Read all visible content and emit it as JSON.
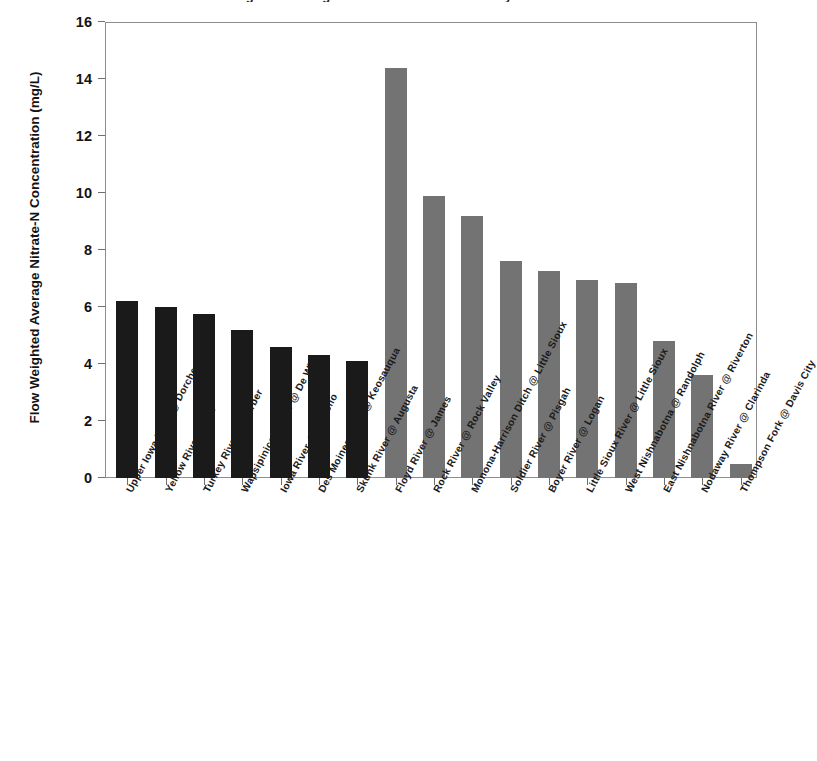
{
  "chart_data": {
    "type": "bar",
    "title": "Flow Weighted Average Nitrate-N Concentration by Watershed",
    "xlabel": "",
    "ylabel": "Flow Weighted Average Nitrate-N Concentration (mg/L)",
    "ylim": [
      0,
      16
    ],
    "yticks": [
      0,
      2,
      4,
      6,
      8,
      10,
      12,
      14,
      16
    ],
    "grid": false,
    "legend": "none",
    "categories": [
      "Upper Iowa River @ Dorchester",
      "Yellow River @ Ion",
      "Turkey River @ Garber",
      "Wapsipinicon River @ De Witt",
      "Iowa River @ Wapello",
      "Des Moines River @ Keosauqua",
      "Skunk River @ Augusta",
      "Floyd River @ James",
      "Rock River @ Rock Valley",
      "Monona-Harrison Ditch @ Little Sioux",
      "Soldier River @ Pisgah",
      "Boyer River @ Logan",
      "Little Sioux River @ Little Sioux",
      "West Nishnabotna @ Randolph",
      "East Nishnabotna River @ Riverton",
      "Nodaway River @ Clarinda",
      "Thompson Fork @ Davis City"
    ],
    "values": [
      6.2,
      6.0,
      5.75,
      5.2,
      4.6,
      4.3,
      4.1,
      14.4,
      9.9,
      9.2,
      7.6,
      7.25,
      6.95,
      6.85,
      4.8,
      3.6,
      0.5
    ],
    "bar_groups": [
      "eastern",
      "eastern",
      "eastern",
      "eastern",
      "eastern",
      "eastern",
      "eastern",
      "western",
      "western",
      "western",
      "western",
      "western",
      "western",
      "western",
      "western",
      "western",
      "western"
    ],
    "colors": {
      "eastern": "#1a1a1a",
      "western": "#737373",
      "axis": "#8d8d8d",
      "text": "#131313",
      "background": "#ffffff"
    }
  }
}
